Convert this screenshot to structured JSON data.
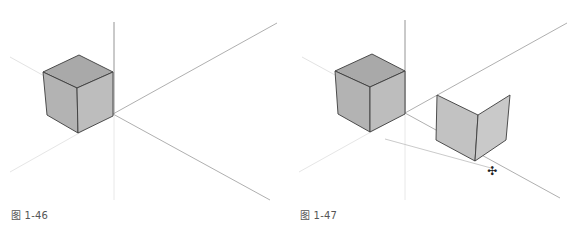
{
  "figures": [
    {
      "caption": "图 1-46",
      "description": "Cube at the origin of 3D axes"
    },
    {
      "caption": "图 1-47",
      "description": "Cube at origin plus two perpendicular faces being moved with move tool"
    }
  ],
  "cursor": {
    "icon": "move-cursor-icon",
    "glyph": "✣"
  },
  "colors": {
    "face_top": "#a9a9a9",
    "face_left": "#b4b4b4",
    "face_right": "#bdbdbd",
    "panel": "#c4c4c4",
    "edge": "#3c3c3c",
    "axis_dark": "#8a8a8a",
    "axis_light": "#e2e2e2"
  }
}
